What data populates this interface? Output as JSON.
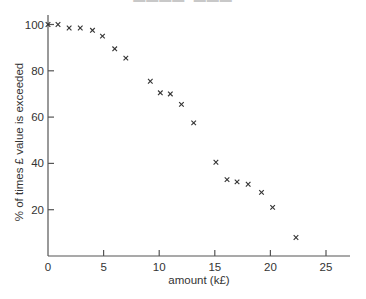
{
  "chart_data": {
    "type": "scatter",
    "title": "",
    "clipped_header_visible": true,
    "xlabel": "amount (k£)",
    "ylabel": "% of times £ value is exceeded",
    "xlim": [
      0,
      27.5
    ],
    "ylim": [
      0,
      104
    ],
    "x_ticks": [
      0,
      5,
      10,
      15,
      20,
      25
    ],
    "y_ticks": [
      20,
      40,
      60,
      80,
      100
    ],
    "y_tick_zero_label": "0",
    "grid": false,
    "legend": null,
    "marker": "x",
    "marker_color": "#333333",
    "axis_color": "#555555",
    "series": [
      {
        "name": "exceedance",
        "points": [
          {
            "x": 0,
            "y": 100
          },
          {
            "x": 0.9,
            "y": 100
          },
          {
            "x": 1.9,
            "y": 98.5
          },
          {
            "x": 2.9,
            "y": 98.5
          },
          {
            "x": 4.0,
            "y": 97.5
          },
          {
            "x": 4.9,
            "y": 95
          },
          {
            "x": 6.0,
            "y": 89.5
          },
          {
            "x": 7.0,
            "y": 85.5
          },
          {
            "x": 9.2,
            "y": 75.5
          },
          {
            "x": 10.1,
            "y": 70.5
          },
          {
            "x": 11.0,
            "y": 70
          },
          {
            "x": 12.0,
            "y": 65.5
          },
          {
            "x": 13.1,
            "y": 57.5
          },
          {
            "x": 15.1,
            "y": 40.5
          },
          {
            "x": 16.1,
            "y": 33
          },
          {
            "x": 17.0,
            "y": 32
          },
          {
            "x": 18.0,
            "y": 31
          },
          {
            "x": 19.2,
            "y": 27.5
          },
          {
            "x": 20.2,
            "y": 21
          },
          {
            "x": 22.3,
            "y": 8
          }
        ]
      }
    ]
  },
  "layout": {
    "origin_px": [
      48,
      256
    ],
    "x_px_per_unit": 11.12,
    "y_px_per_unit": 2.315,
    "x_axis_end_px": 350,
    "y_axis_top_px": 15
  }
}
